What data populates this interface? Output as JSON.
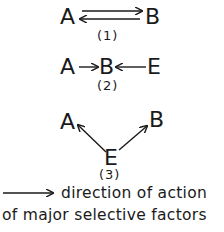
{
  "diagram": {
    "panels": [
      {
        "id": "1",
        "caption": "(1)",
        "nodes": {
          "left": "A",
          "right": "B"
        },
        "relation": "A and B act on each other (reciprocal arrows A→B and B→A)"
      },
      {
        "id": "2",
        "caption": "(2)",
        "nodes": {
          "left": "A",
          "center": "B",
          "right": "E"
        },
        "relation": "A→B and E→B"
      },
      {
        "id": "3",
        "caption": "(3)",
        "nodes": {
          "top_left": "A",
          "top_right": "B",
          "bottom": "E"
        },
        "relation": "E→A and E→B"
      }
    ],
    "legend": {
      "symbol": "arrow",
      "line1": "direction of action",
      "line2": "of major selective factors"
    },
    "colors": {
      "ink": "#1a1a1a",
      "background": "#ffffff"
    }
  }
}
